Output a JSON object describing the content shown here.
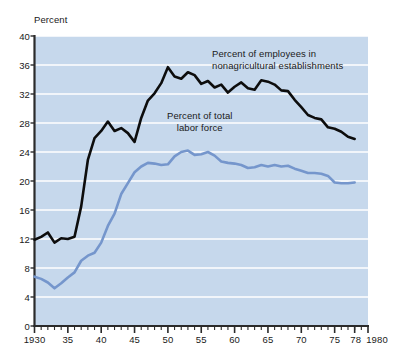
{
  "chart_data": {
    "type": "line",
    "title": "",
    "ylabel": "Percent",
    "xlabel": "",
    "xlim": [
      1930,
      1980
    ],
    "ylim": [
      0,
      40
    ],
    "ytick_labels": [
      "0",
      "4",
      "8",
      "12",
      "16",
      "20",
      "24",
      "28",
      "32",
      "36",
      "40"
    ],
    "ytick_values": [
      0,
      4,
      8,
      12,
      16,
      20,
      24,
      28,
      32,
      36,
      40
    ],
    "xtick_labels": [
      "1930",
      "35",
      "40",
      "45",
      "50",
      "55",
      "60",
      "65",
      "70",
      "75",
      "78",
      "1980"
    ],
    "xtick_values": [
      1930,
      1935,
      1940,
      1945,
      1950,
      1955,
      1960,
      1965,
      1970,
      1975,
      1978,
      1980
    ],
    "grid": "horizontal-white",
    "legend_position": "inline-annotation",
    "plot_bg_color": "#c6d8ec",
    "grid_color": "#ffffff",
    "series": [
      {
        "name": "Percent of employees in nonagricultural establishments",
        "color": "#0d0d0d",
        "label_text": "Percent of employees in\nnonagricultural establishments",
        "x": [
          1930,
          1931,
          1932,
          1933,
          1934,
          1935,
          1936,
          1937,
          1938,
          1939,
          1940,
          1941,
          1942,
          1943,
          1944,
          1945,
          1946,
          1947,
          1948,
          1949,
          1950,
          1951,
          1952,
          1953,
          1954,
          1955,
          1956,
          1957,
          1958,
          1959,
          1960,
          1961,
          1962,
          1963,
          1964,
          1965,
          1966,
          1967,
          1968,
          1969,
          1970,
          1971,
          1972,
          1973,
          1974,
          1975,
          1976,
          1977,
          1978
        ],
        "values": [
          11.9,
          12.3,
          12.9,
          11.5,
          12.1,
          12.0,
          12.3,
          16.5,
          22.9,
          25.9,
          26.9,
          28.2,
          26.9,
          27.3,
          26.6,
          25.4,
          28.7,
          31.1,
          32.1,
          33.5,
          35.7,
          34.4,
          34.1,
          35.0,
          34.6,
          33.4,
          33.8,
          32.9,
          33.3,
          32.2,
          33.0,
          33.6,
          32.8,
          32.6,
          33.9,
          33.7,
          33.3,
          32.5,
          32.4,
          31.2,
          30.2,
          29.1,
          28.7,
          28.5,
          27.4,
          27.2,
          26.8,
          26.1,
          25.8
        ]
      },
      {
        "name": "Percent of total labor force",
        "color": "#7596cc",
        "label_text": "Percent of total\nlabor force",
        "x": [
          1930,
          1931,
          1932,
          1933,
          1934,
          1935,
          1936,
          1937,
          1938,
          1939,
          1940,
          1941,
          1942,
          1943,
          1944,
          1945,
          1946,
          1947,
          1948,
          1949,
          1950,
          1951,
          1952,
          1953,
          1954,
          1955,
          1956,
          1957,
          1958,
          1959,
          1960,
          1961,
          1962,
          1963,
          1964,
          1965,
          1966,
          1967,
          1968,
          1969,
          1970,
          1971,
          1972,
          1973,
          1974,
          1975,
          1976,
          1977,
          1978
        ],
        "values": [
          6.8,
          6.5,
          6.0,
          5.2,
          5.9,
          6.7,
          7.4,
          9.0,
          9.7,
          10.1,
          11.5,
          13.8,
          15.5,
          18.2,
          19.7,
          21.2,
          22.0,
          22.5,
          22.4,
          22.2,
          22.3,
          23.4,
          24.0,
          24.2,
          23.6,
          23.7,
          24.0,
          23.5,
          22.7,
          22.5,
          22.4,
          22.2,
          21.8,
          21.9,
          22.2,
          22.0,
          22.2,
          22.0,
          22.1,
          21.7,
          21.4,
          21.1,
          21.1,
          21.0,
          20.7,
          19.8,
          19.7,
          19.7,
          19.8
        ]
      }
    ]
  },
  "axis": {
    "y_title": "Percent"
  }
}
